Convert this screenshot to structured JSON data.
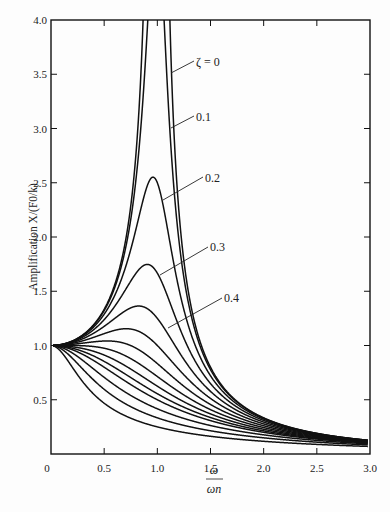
{
  "chart_data": {
    "type": "line",
    "title": "",
    "xlabel_num": "ω",
    "xlabel_den": "ωn",
    "ylabel": "Amplification X/(F0/k)",
    "xlim": [
      0,
      3.0
    ],
    "ylim": [
      0,
      4.0
    ],
    "x_ticks": [
      "0",
      "0.5",
      "1.0",
      "1.5",
      "2.0",
      "2.5",
      "3.0"
    ],
    "y_ticks": [
      "0.5",
      "1.0",
      "1.5",
      "2.0",
      "2.5",
      "3.0",
      "3.5",
      "4.0"
    ],
    "grid": false,
    "formula": "X/(F0/k) = 1/sqrt((1-r^2)^2 + (2ζr)^2), r = ω/ωn",
    "series_damping_ratios": [
      0,
      0.1,
      0.2,
      0.3,
      0.4,
      0.5,
      0.6,
      0.7,
      0.8,
      0.9,
      1.0,
      1.2,
      1.5,
      2.0
    ],
    "annotations": [
      {
        "text": "ζ = 0",
        "zeta": 0
      },
      {
        "text": "0.1",
        "zeta": 0.1
      },
      {
        "text": "0.2",
        "zeta": 0.2
      },
      {
        "text": "0.3",
        "zeta": 0.3
      },
      {
        "text": "0.4",
        "zeta": 0.4
      }
    ],
    "peak_values_approx": {
      "0.1": 5.03,
      "0.2": 2.55,
      "0.3": 1.75,
      "0.4": 1.36
    }
  }
}
